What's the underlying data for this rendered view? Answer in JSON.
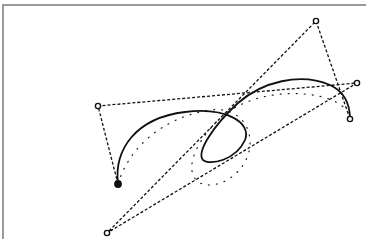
{
  "diagram": {
    "type": "bezier-spline-construction",
    "canvas": {
      "width": 366,
      "height": 239,
      "background": "#ffffff",
      "border_color": "#9a9a9a"
    },
    "colors": {
      "stroke": "#111111",
      "point_fill_open": "#ffffff",
      "point_fill_start": "#111111"
    },
    "control_points": [
      {
        "id": "start",
        "x": 118,
        "y": 184,
        "style": "filled"
      },
      {
        "id": "p1",
        "x": 98,
        "y": 106,
        "style": "open"
      },
      {
        "id": "p2",
        "x": 357,
        "y": 83,
        "style": "open"
      },
      {
        "id": "p3",
        "x": 107,
        "y": 233,
        "style": "open"
      },
      {
        "id": "p4",
        "x": 316,
        "y": 21,
        "style": "open"
      },
      {
        "id": "end",
        "x": 350,
        "y": 119,
        "style": "open"
      }
    ],
    "control_polygon": {
      "style": "dashed",
      "path": "M118,184 L98,106 L357,83 L107,233 L316,21 L350,119"
    },
    "solid_curve": {
      "style": "solid",
      "path": "M118,184 C114,150 135,118 185,112 C225,107 252,122 245,140 C236,160 210,166 203,160 C196,152 214,125 238,103 C262,82 300,72 330,85 C345,92 350,105 350,119"
    },
    "dotted_curve": {
      "style": "dotted",
      "path": "M118,184 C128,150 160,118 210,110 C240,106 256,130 248,155 C240,178 215,190 200,183 C186,175 188,150 220,118 C250,92 300,88 332,100 C345,106 350,113 350,119"
    }
  }
}
